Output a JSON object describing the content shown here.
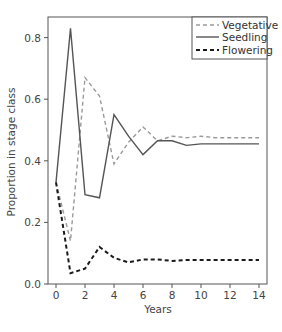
{
  "chart_data": {
    "type": "line",
    "title": "",
    "xlabel": "Years",
    "ylabel": "Proportion in stage class",
    "xlim": [
      -0.5,
      14.7
    ],
    "ylim": [
      0.0,
      0.86
    ],
    "x_ticks": [
      0,
      2,
      4,
      6,
      8,
      10,
      12,
      14
    ],
    "x_tick_labels": [
      "0",
      "2",
      "4",
      "6",
      "8",
      "10",
      "12",
      "14"
    ],
    "y_ticks": [
      0.0,
      0.2,
      0.4,
      0.6,
      0.8
    ],
    "y_tick_labels": [
      "0.0",
      "0.2",
      "0.4",
      "0.6",
      "0.8"
    ],
    "grid": false,
    "legend_position": "upper right",
    "x": [
      0,
      1,
      2,
      3,
      4,
      5,
      6,
      7,
      8,
      9,
      10,
      11,
      12,
      13,
      14
    ],
    "series": [
      {
        "name": "Vegetative",
        "style": "dashed",
        "color": "#9a9a9a",
        "values": [
          0.33,
          0.14,
          0.67,
          0.61,
          0.39,
          0.46,
          0.51,
          0.465,
          0.48,
          0.475,
          0.48,
          0.475,
          0.475,
          0.475,
          0.475
        ]
      },
      {
        "name": "Seedling",
        "style": "solid",
        "color": "#555555",
        "values": [
          0.33,
          0.83,
          0.29,
          0.28,
          0.55,
          0.48,
          0.42,
          0.465,
          0.465,
          0.45,
          0.455,
          0.455,
          0.455,
          0.455,
          0.455
        ]
      },
      {
        "name": "Flowering",
        "style": "dashed-bold",
        "color": "#1a1a1a",
        "values": [
          0.33,
          0.035,
          0.05,
          0.12,
          0.085,
          0.07,
          0.08,
          0.08,
          0.075,
          0.078,
          0.078,
          0.078,
          0.078,
          0.078,
          0.078
        ]
      }
    ]
  },
  "legend": {
    "items": [
      {
        "label": "Vegetative"
      },
      {
        "label": "Seedling"
      },
      {
        "label": "Flowering"
      }
    ]
  }
}
